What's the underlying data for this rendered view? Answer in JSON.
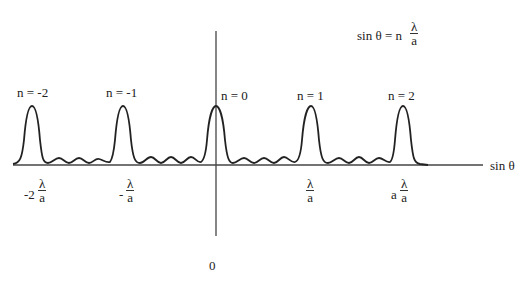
{
  "equation": {
    "lhs": "sin θ = n",
    "num": "λ",
    "den": "a"
  },
  "axis": {
    "x_label": "sin θ",
    "origin_label": "0"
  },
  "orders": [
    {
      "label": "n = -2",
      "x": 32
    },
    {
      "label": "n = -1",
      "x": 123
    },
    {
      "label": "n = 0",
      "x": 216
    },
    {
      "label": "n = 1",
      "x": 311
    },
    {
      "label": "n = 2",
      "x": 403
    }
  ],
  "ticks": [
    {
      "prefix": "-2",
      "num": "λ",
      "den": "a"
    },
    {
      "prefix": "-",
      "num": "λ",
      "den": "a"
    },
    {
      "prefix": "",
      "num": "λ",
      "den": "a"
    },
    {
      "prefix": "a",
      "num": "λ",
      "den": "a"
    }
  ],
  "colors": {
    "line": "#222222",
    "background": "#ffffff"
  }
}
